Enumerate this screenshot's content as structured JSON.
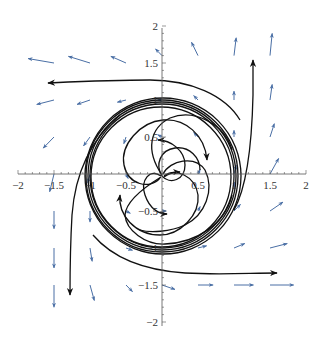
{
  "chart_data": {
    "type": "vector_field_phase_portrait",
    "title": "",
    "xlabel": "",
    "ylabel": "",
    "xlim": [
      -2,
      2
    ],
    "ylim": [
      -2,
      2
    ],
    "grid": false,
    "legend": null,
    "x_ticks": [
      "-2",
      "-1.5",
      "-1",
      "-0.5",
      "0.5",
      "1",
      "1.5",
      "2"
    ],
    "y_ticks": [
      "2",
      "1.5",
      "1",
      "0.5",
      "-0.5",
      "-1",
      "-1.5",
      "-2"
    ],
    "x_tick_values": [
      -2,
      -1.5,
      -1,
      -0.5,
      0.5,
      1,
      1.5,
      2
    ],
    "y_tick_values": [
      2,
      1.5,
      1,
      0.5,
      -0.5,
      -1,
      -1.5,
      -2
    ],
    "vector_color": "#4a6fa5",
    "trajectory_color": "#111111",
    "limit_cycle_radius": 1,
    "vectors": [
      {
        "x": -1.5,
        "y": 1.5,
        "dx": -0.6,
        "dy": 0.1
      },
      {
        "x": -1.0,
        "y": 1.5,
        "dx": -0.5,
        "dy": 0.15
      },
      {
        "x": -0.5,
        "y": 1.5,
        "dx": -0.35,
        "dy": 0.15
      },
      {
        "x": 0.0,
        "y": 1.6,
        "dx": -0.15,
        "dy": 0.15
      },
      {
        "x": 0.5,
        "y": 1.6,
        "dx": -0.15,
        "dy": 0.3
      },
      {
        "x": 1.0,
        "y": 1.6,
        "dx": 0.05,
        "dy": 0.4
      },
      {
        "x": 1.5,
        "y": 1.6,
        "dx": 0.05,
        "dy": 0.5
      },
      {
        "x": -1.5,
        "y": 1.0,
        "dx": -0.4,
        "dy": -0.1
      },
      {
        "x": -1.0,
        "y": 1.0,
        "dx": -0.3,
        "dy": -0.1
      },
      {
        "x": -0.5,
        "y": 1.0,
        "dx": -0.2,
        "dy": -0.05
      },
      {
        "x": 0.0,
        "y": 1.0,
        "dx": -0.1,
        "dy": 0.0
      },
      {
        "x": 0.5,
        "y": 1.0,
        "dx": -0.1,
        "dy": 0.1
      },
      {
        "x": 1.0,
        "y": 1.0,
        "dx": 0.0,
        "dy": 0.2
      },
      {
        "x": 1.5,
        "y": 1.0,
        "dx": 0.05,
        "dy": 0.35
      },
      {
        "x": -1.5,
        "y": 0.5,
        "dx": -0.25,
        "dy": -0.25
      },
      {
        "x": -1.0,
        "y": 0.5,
        "dx": -0.15,
        "dy": -0.2
      },
      {
        "x": -0.5,
        "y": 0.5,
        "dx": -0.05,
        "dy": -0.15
      },
      {
        "x": 0.0,
        "y": 0.5,
        "dx": -0.1,
        "dy": 0.05
      },
      {
        "x": 0.5,
        "y": 0.5,
        "dx": -0.1,
        "dy": 0.1
      },
      {
        "x": 1.0,
        "y": 0.5,
        "dx": 0.0,
        "dy": 0.15
      },
      {
        "x": 1.5,
        "y": 0.5,
        "dx": 0.1,
        "dy": 0.3
      },
      {
        "x": -1.5,
        "y": 0.0,
        "dx": -0.1,
        "dy": -0.4
      },
      {
        "x": -1.0,
        "y": 0.0,
        "dx": -0.05,
        "dy": -0.2
      },
      {
        "x": -0.5,
        "y": 0.0,
        "dx": 0.05,
        "dy": -0.1
      },
      {
        "x": 0.5,
        "y": 0.0,
        "dx": 0.05,
        "dy": 0.1
      },
      {
        "x": 1.0,
        "y": 0.0,
        "dx": 0.05,
        "dy": 0.2
      },
      {
        "x": 1.5,
        "y": 0.0,
        "dx": 0.2,
        "dy": 0.35
      },
      {
        "x": -1.5,
        "y": -0.5,
        "dx": 0.0,
        "dy": -0.4
      },
      {
        "x": -1.0,
        "y": -0.5,
        "dx": 0.0,
        "dy": -0.25
      },
      {
        "x": -0.5,
        "y": -0.5,
        "dx": 0.1,
        "dy": -0.05
      },
      {
        "x": 0.0,
        "y": -0.5,
        "dx": 0.1,
        "dy": 0.0
      },
      {
        "x": 0.5,
        "y": -0.5,
        "dx": 0.05,
        "dy": 0.1
      },
      {
        "x": 1.0,
        "y": -0.5,
        "dx": 0.15,
        "dy": 0.15
      },
      {
        "x": 1.5,
        "y": -0.5,
        "dx": 0.3,
        "dy": 0.2
      },
      {
        "x": -1.5,
        "y": -1.0,
        "dx": 0.0,
        "dy": -0.45
      },
      {
        "x": -1.0,
        "y": -1.0,
        "dx": 0.05,
        "dy": -0.3
      },
      {
        "x": -0.5,
        "y": -1.0,
        "dx": 0.15,
        "dy": -0.05
      },
      {
        "x": 0.5,
        "y": -1.0,
        "dx": 0.2,
        "dy": 0.05
      },
      {
        "x": 1.0,
        "y": -1.0,
        "dx": 0.25,
        "dy": 0.1
      },
      {
        "x": 1.5,
        "y": -1.0,
        "dx": 0.4,
        "dy": 0.1
      },
      {
        "x": -1.5,
        "y": -1.5,
        "dx": 0.0,
        "dy": -0.5
      },
      {
        "x": -1.0,
        "y": -1.5,
        "dx": 0.1,
        "dy": -0.35
      },
      {
        "x": -0.5,
        "y": -1.5,
        "dx": 0.15,
        "dy": -0.15
      },
      {
        "x": 0.0,
        "y": -1.5,
        "dx": 0.3,
        "dy": -0.1
      },
      {
        "x": 0.5,
        "y": -1.5,
        "dx": 0.35,
        "dy": 0.0
      },
      {
        "x": 1.0,
        "y": -1.5,
        "dx": 0.45,
        "dy": 0.0
      },
      {
        "x": 1.5,
        "y": -1.5,
        "dx": 0.55,
        "dy": 0.0
      }
    ]
  }
}
